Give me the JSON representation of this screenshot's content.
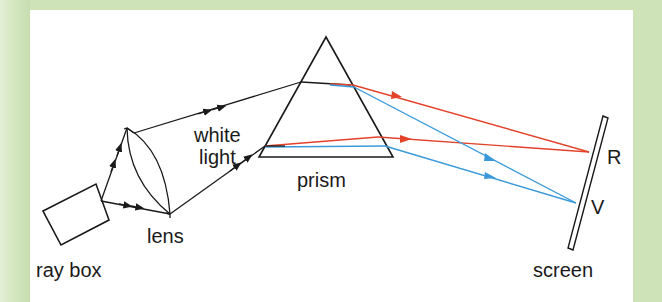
{
  "diagram": {
    "labels": {
      "ray_box": "ray box",
      "lens": "lens",
      "white_light_line1": "white",
      "white_light_line2": "light",
      "prism": "prism",
      "screen": "screen",
      "red_mark": "R",
      "violet_mark": "V"
    },
    "components": [
      "ray box",
      "lens",
      "prism",
      "screen"
    ],
    "colors": {
      "background_border": "#cfe3b8",
      "panel": "#ffffff",
      "outline": "#1a1a1a",
      "red_ray": "#e2432a",
      "blue_ray": "#3a9ad9"
    }
  }
}
